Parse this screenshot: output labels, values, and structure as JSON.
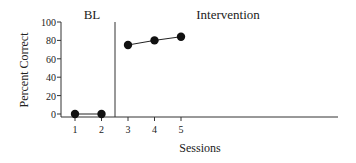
{
  "chart_data": {
    "type": "line",
    "title": "",
    "xlabel": "Sessions",
    "ylabel": "Percent Correct",
    "ylim": [
      0,
      100
    ],
    "yticks": [
      0,
      20,
      40,
      60,
      80,
      100
    ],
    "xticks": [
      1,
      2,
      3,
      4,
      5
    ],
    "grid": false,
    "phases": [
      {
        "name": "BL",
        "sessions": [
          1,
          2
        ]
      },
      {
        "name": "Intervention",
        "sessions": [
          3,
          4,
          5
        ]
      }
    ],
    "series": [
      {
        "name": "BL",
        "x": [
          1,
          2
        ],
        "values": [
          0,
          0
        ]
      },
      {
        "name": "Intervention",
        "x": [
          3,
          4,
          5
        ],
        "values": [
          75,
          80,
          84
        ]
      }
    ],
    "phase_change_line_after_session": 2
  },
  "labels": {
    "phase1": "BL",
    "phase2": "Intervention",
    "xlabel": "Sessions",
    "ylabel": "Percent Correct",
    "yticks": [
      "0",
      "20",
      "40",
      "60",
      "80",
      "100"
    ],
    "xticks": [
      "1",
      "2",
      "3",
      "4",
      "5"
    ]
  },
  "colors": {
    "axis": "#333333",
    "marker": "#111111",
    "text": "#222222"
  }
}
